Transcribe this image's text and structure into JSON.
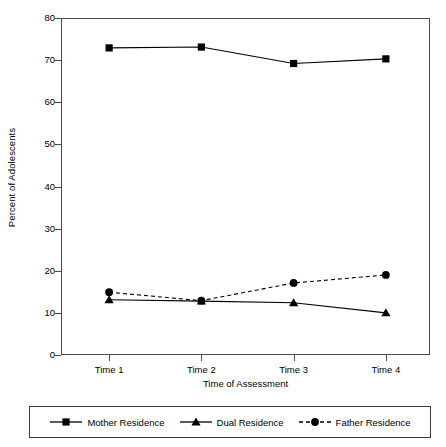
{
  "chart_data": {
    "type": "line",
    "title": "",
    "xlabel": "Time of Assessment",
    "ylabel": "Percent of Adolescents",
    "categories": [
      "Time 1",
      "Time 2",
      "Time 3",
      "Time 4"
    ],
    "ylim": [
      0,
      80
    ],
    "yticks": [
      0,
      10,
      20,
      30,
      40,
      50,
      60,
      70,
      80
    ],
    "ytick_labels": [
      "0",
      "10",
      "20",
      "30",
      "40",
      "50",
      "60",
      "70",
      "80"
    ],
    "grid": false,
    "legend_position": "bottom",
    "series": [
      {
        "name": "Mother Residence",
        "values": [
          72.9,
          73.1,
          69.2,
          70.3
        ],
        "marker": "square",
        "linestyle": "solid",
        "color": "#000000"
      },
      {
        "name": "Dual Residence",
        "values": [
          13.1,
          12.8,
          12.4,
          10.0
        ],
        "marker": "triangle",
        "linestyle": "solid",
        "color": "#000000"
      },
      {
        "name": "Father Residence",
        "values": [
          14.9,
          12.9,
          17.1,
          19.0
        ],
        "marker": "circle",
        "linestyle": "dashed",
        "color": "#000000"
      }
    ]
  },
  "axes": {
    "y_title": "Percent of Adolescents",
    "x_title": "Time of Assessment"
  },
  "legend": {
    "entries": [
      {
        "label": "Mother Residence",
        "marker": "square-marker-icon",
        "linestyle": "solid"
      },
      {
        "label": "Dual Residence",
        "marker": "triangle-marker-icon",
        "linestyle": "solid"
      },
      {
        "label": "Father Residence",
        "marker": "circle-marker-icon",
        "linestyle": "dashed"
      }
    ]
  },
  "colors": {
    "line": "#000000",
    "frame": "#4a4a4a",
    "background": "#ffffff"
  }
}
